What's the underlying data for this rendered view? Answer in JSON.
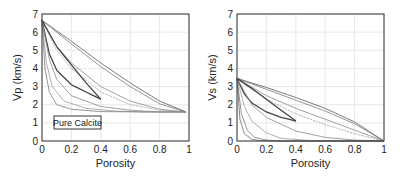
{
  "chart_data": [
    {
      "type": "line",
      "title": "",
      "xlabel": "Porosity",
      "ylabel": "Vp (km/s)",
      "xlim": [
        0,
        1
      ],
      "ylim": [
        0,
        7
      ],
      "xticks": [
        "0",
        "0.2",
        "0.4",
        "0.6",
        "0.8",
        "1"
      ],
      "yticks": [
        "0",
        "1",
        "2",
        "3",
        "4",
        "5",
        "6",
        "7"
      ],
      "grid": true,
      "legend": null,
      "annotation": "Pure Calcite",
      "series": [
        {
          "name": "upper bound 1",
          "x": [
            0,
            0.2,
            0.4,
            0.6,
            0.8,
            0.98
          ],
          "y": [
            6.65,
            5.5,
            4.3,
            3.2,
            2.2,
            1.6
          ]
        },
        {
          "name": "upper bound 2",
          "x": [
            0,
            0.2,
            0.4,
            0.6,
            0.8,
            0.98
          ],
          "y": [
            6.65,
            5.35,
            4.1,
            3.0,
            2.05,
            1.6
          ]
        },
        {
          "name": "mid curve 1",
          "x": [
            0,
            0.1,
            0.2,
            0.4,
            0.6,
            0.8,
            0.98
          ],
          "y": [
            6.65,
            5.2,
            4.3,
            3.0,
            2.2,
            1.75,
            1.6
          ]
        },
        {
          "name": "mid curve 2",
          "x": [
            0,
            0.1,
            0.2,
            0.4,
            0.6,
            0.8,
            0.98
          ],
          "y": [
            6.65,
            5.0,
            4.0,
            2.7,
            2.0,
            1.7,
            1.6
          ]
        },
        {
          "name": "cemented trend",
          "x": [
            0,
            0.1,
            0.2,
            0.3,
            0.4
          ],
          "y": [
            6.65,
            5.2,
            4.2,
            3.2,
            2.3
          ]
        },
        {
          "name": "uncemented trend",
          "x": [
            0,
            0.05,
            0.1,
            0.2,
            0.3,
            0.4
          ],
          "y": [
            6.65,
            4.8,
            3.9,
            3.1,
            2.7,
            2.3
          ]
        },
        {
          "name": "soft curve 1",
          "x": [
            0,
            0.05,
            0.1,
            0.2,
            0.4,
            0.6,
            0.8,
            0.98
          ],
          "y": [
            6.65,
            4.5,
            3.4,
            2.5,
            1.9,
            1.7,
            1.6,
            1.6
          ]
        },
        {
          "name": "soft curve 2",
          "x": [
            0,
            0.03,
            0.07,
            0.15,
            0.3,
            0.5,
            0.7,
            0.98
          ],
          "y": [
            6.65,
            4.3,
            3.0,
            2.2,
            1.8,
            1.65,
            1.6,
            1.6
          ]
        },
        {
          "name": "lower bound",
          "x": [
            0,
            0.02,
            0.05,
            0.1,
            0.2,
            0.4,
            0.7,
            0.98
          ],
          "y": [
            6.65,
            4.0,
            2.7,
            2.0,
            1.75,
            1.62,
            1.6,
            1.6
          ]
        }
      ]
    },
    {
      "type": "line",
      "title": "",
      "xlabel": "Porosity",
      "ylabel": "Vs (km/s)",
      "xlim": [
        0,
        1
      ],
      "ylim": [
        0,
        7
      ],
      "xticks": [
        "0",
        "0.2",
        "0.4",
        "0.6",
        "0.8",
        "1"
      ],
      "yticks": [
        "0",
        "1",
        "2",
        "3",
        "4",
        "5",
        "6",
        "7"
      ],
      "grid": true,
      "legend": null,
      "series": [
        {
          "name": "upper bound 1",
          "x": [
            0,
            0.2,
            0.4,
            0.6,
            0.8,
            1.0
          ],
          "y": [
            3.45,
            2.95,
            2.4,
            1.8,
            1.05,
            0.0
          ]
        },
        {
          "name": "upper bound 2",
          "x": [
            0,
            0.2,
            0.4,
            0.6,
            0.8,
            1.0
          ],
          "y": [
            3.45,
            2.85,
            2.25,
            1.65,
            0.95,
            0.0
          ]
        },
        {
          "name": "mid curve 1",
          "x": [
            0,
            0.2,
            0.4,
            0.6,
            0.8,
            1.0
          ],
          "y": [
            3.45,
            2.5,
            1.8,
            1.2,
            0.6,
            0.0
          ]
        },
        {
          "name": "mid curve 2",
          "x": [
            0,
            0.2,
            0.4,
            0.6,
            0.8,
            1.0
          ],
          "y": [
            3.45,
            2.3,
            1.5,
            0.9,
            0.4,
            0.0
          ]
        },
        {
          "name": "cemented trend",
          "x": [
            0,
            0.1,
            0.2,
            0.3,
            0.4
          ],
          "y": [
            3.45,
            2.9,
            2.3,
            1.7,
            1.1
          ]
        },
        {
          "name": "uncemented trend",
          "x": [
            0,
            0.05,
            0.1,
            0.2,
            0.3,
            0.4
          ],
          "y": [
            3.45,
            2.6,
            2.1,
            1.6,
            1.3,
            1.1
          ]
        },
        {
          "name": "soft curve 1",
          "x": [
            0,
            0.1,
            0.2,
            0.4,
            0.6,
            0.8,
            1.0
          ],
          "y": [
            3.45,
            2.0,
            1.3,
            0.55,
            0.2,
            0.05,
            0.0
          ]
        },
        {
          "name": "soft curve 2",
          "x": [
            0,
            0.05,
            0.1,
            0.2,
            0.3,
            0.5,
            1.0
          ],
          "y": [
            3.45,
            1.9,
            1.1,
            0.45,
            0.15,
            0.02,
            0.0
          ]
        },
        {
          "name": "soft curve 3",
          "x": [
            0,
            0.03,
            0.07,
            0.12,
            0.2,
            0.3,
            1.0
          ],
          "y": [
            3.45,
            1.5,
            0.6,
            0.2,
            0.05,
            0.0,
            0.0
          ]
        },
        {
          "name": "lower bound",
          "x": [
            0,
            0.02,
            0.05,
            0.1,
            0.15,
            0.25,
            1.0
          ],
          "y": [
            3.45,
            1.2,
            0.4,
            0.1,
            0.02,
            0.0,
            0.0
          ]
        }
      ]
    }
  ]
}
